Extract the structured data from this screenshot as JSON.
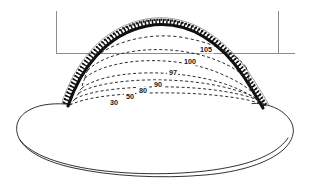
{
  "figure": {
    "name": "contour-map-diagram",
    "background_color": "#ffffff",
    "ink_color": "#111111",
    "grid_color": "#8c8c8c"
  },
  "grid": {
    "vertical_left": {
      "label": "",
      "x": 56,
      "y1": 11,
      "y2": 53
    },
    "vertical_right": {
      "label": "",
      "x": 278,
      "y1": 11,
      "y2": 53
    },
    "horizontal": {
      "label": "",
      "y": 53,
      "x1": 56,
      "x2": 295
    }
  },
  "contours": [
    {
      "label": "105",
      "value": 105,
      "label_x": 206,
      "label_y": 52
    },
    {
      "label": "100",
      "value": 100,
      "label_x": 190,
      "label_y": 64
    },
    {
      "label": "97",
      "value": 97,
      "label_x": 173,
      "label_y": 75
    },
    {
      "label": "90",
      "value": 90,
      "label_x": 158,
      "label_y": 87
    },
    {
      "label": "80",
      "value": 80,
      "label_x": 143,
      "label_y": 93
    },
    {
      "label": "50",
      "value": 50,
      "label_x": 130,
      "label_y": 99
    },
    {
      "label": "30",
      "value": 30,
      "label_x": 114,
      "label_y": 105
    }
  ],
  "crest": {
    "name": "hatched-crest-rim",
    "style": "solid thick arc with perpendicular tick hatching on outer side"
  },
  "outline": {
    "name": "deposit-outer-boundary",
    "style": "thin solid closed curve"
  }
}
